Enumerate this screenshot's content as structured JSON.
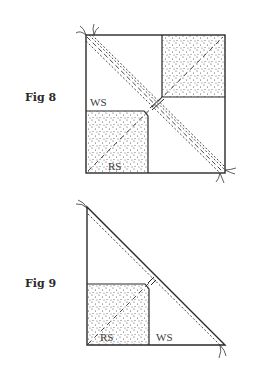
{
  "figures": [
    {
      "id": "fig8",
      "label": "Fig 8",
      "shape": "square-four-patch",
      "labels": {
        "wrong_side": "WS",
        "right_side": "RS"
      }
    },
    {
      "id": "fig9",
      "label": "Fig 9",
      "shape": "right-triangle",
      "labels": {
        "right_side": "RS",
        "wrong_side": "WS"
      }
    }
  ],
  "colors": {
    "line": "#2a2a2a",
    "stipple": "#4a4a4a",
    "background": "#ffffff"
  }
}
